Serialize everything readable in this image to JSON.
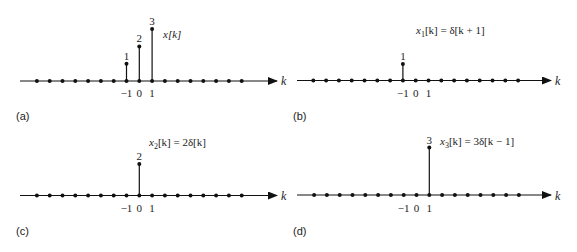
{
  "figure": {
    "panels": [
      {
        "id": "a",
        "label": "(a)",
        "equation": "x[k]",
        "axis_label": "k",
        "tick_labels": [
          "−1",
          "0",
          "1"
        ],
        "stems": [
          {
            "k": -1,
            "value": 1,
            "label": "1"
          },
          {
            "k": 0,
            "value": 2,
            "label": "2"
          },
          {
            "k": 1,
            "value": 3,
            "label": "3"
          }
        ]
      },
      {
        "id": "b",
        "label": "(b)",
        "equation_parts": {
          "lhs": "x",
          "sub": "1",
          "rest": "[k] = δ[k + 1]"
        },
        "axis_label": "k",
        "tick_labels": [
          "−1",
          "0",
          "1"
        ],
        "stems": [
          {
            "k": -1,
            "value": 1,
            "label": "1"
          }
        ]
      },
      {
        "id": "c",
        "label": "(c)",
        "equation_parts": {
          "lhs": "x",
          "sub": "2",
          "rest": "[k] = 2δ[k]"
        },
        "axis_label": "k",
        "tick_labels": [
          "−1",
          "0",
          "1"
        ],
        "stems": [
          {
            "k": 0,
            "value": 2,
            "label": "2"
          }
        ]
      },
      {
        "id": "d",
        "label": "(d)",
        "equation_parts": {
          "lhs": "x",
          "sub": "3",
          "rest": "[k] = 3δ[k − 1]"
        },
        "axis_label": "k",
        "tick_labels": [
          "−1",
          "0",
          "1"
        ],
        "stems": [
          {
            "k": 1,
            "value": 3,
            "label": "3"
          }
        ]
      }
    ]
  },
  "chart_data": [
    {
      "type": "stem",
      "title": "x[k]",
      "xlabel": "k",
      "x": [
        -8,
        -7,
        -6,
        -5,
        -4,
        -3,
        -2,
        -1,
        0,
        1,
        2,
        3,
        4,
        5,
        6,
        7,
        8
      ],
      "values": [
        0,
        0,
        0,
        0,
        0,
        0,
        0,
        1,
        2,
        3,
        0,
        0,
        0,
        0,
        0,
        0,
        0
      ],
      "panel": "(a)"
    },
    {
      "type": "stem",
      "title": "x1[k] = δ[k + 1]",
      "xlabel": "k",
      "x": [
        -8,
        -7,
        -6,
        -5,
        -4,
        -3,
        -2,
        -1,
        0,
        1,
        2,
        3,
        4,
        5,
        6,
        7,
        8
      ],
      "values": [
        0,
        0,
        0,
        0,
        0,
        0,
        0,
        1,
        0,
        0,
        0,
        0,
        0,
        0,
        0,
        0,
        0
      ],
      "panel": "(b)"
    },
    {
      "type": "stem",
      "title": "x2[k] = 2δ[k]",
      "xlabel": "k",
      "x": [
        -8,
        -7,
        -6,
        -5,
        -4,
        -3,
        -2,
        -1,
        0,
        1,
        2,
        3,
        4,
        5,
        6,
        7,
        8
      ],
      "values": [
        0,
        0,
        0,
        0,
        0,
        0,
        0,
        0,
        2,
        0,
        0,
        0,
        0,
        0,
        0,
        0,
        0
      ],
      "panel": "(c)"
    },
    {
      "type": "stem",
      "title": "x3[k] = 3δ[k − 1]",
      "xlabel": "k",
      "x": [
        -8,
        -7,
        -6,
        -5,
        -4,
        -3,
        -2,
        -1,
        0,
        1,
        2,
        3,
        4,
        5,
        6,
        7,
        8
      ],
      "values": [
        0,
        0,
        0,
        0,
        0,
        0,
        0,
        0,
        0,
        3,
        0,
        0,
        0,
        0,
        0,
        0,
        0
      ],
      "panel": "(d)"
    }
  ]
}
